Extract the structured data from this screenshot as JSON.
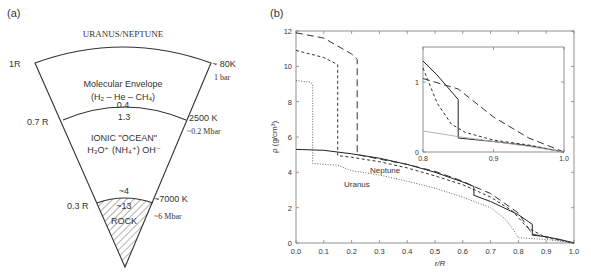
{
  "panel_a": {
    "label": "(a)",
    "title": "URANUS/NEPTUNE",
    "radius_labels": [
      "1R",
      "0.7 R",
      "0.3 R"
    ],
    "layers": [
      {
        "name": "Molecular Envelope",
        "composition": "(H₂ – He – CH₄)",
        "density_top": "",
        "density_bottom": "0.4"
      },
      {
        "name": "IONIC \"OCEAN\"",
        "composition": "H₃O⁺ (NH₄⁺) OH⁻",
        "density_top": "1.3",
        "density_bottom": "~4"
      },
      {
        "name": "ROCK",
        "composition": "",
        "density_top": "~13",
        "density_bottom": ""
      }
    ],
    "boundary_conditions": [
      {
        "temperature": "~ 80K",
        "pressure": "1 bar"
      },
      {
        "temperature": "2500 K",
        "pressure": "~0.2 Mbar"
      },
      {
        "temperature": "~7000 K",
        "pressure": "~6 Mbar"
      }
    ]
  },
  "panel_b": {
    "label": "(b)",
    "curve_labels": {
      "neptune": "Neptune",
      "uranus": "Uranus"
    }
  },
  "chart_data": [
    {
      "type": "line",
      "title": "(b) Density profiles of Uranus and Neptune",
      "xlabel": "r/R",
      "ylabel": "ρ (g/cm³)",
      "xlim": [
        0.0,
        1.0
      ],
      "ylim": [
        0,
        12
      ],
      "xticks": [
        "0.0",
        "0.1",
        "0.2",
        "0.3",
        "0.4",
        "0.5",
        "0.6",
        "0.7",
        "0.8",
        "0.9",
        "1.0"
      ],
      "yticks": [
        "0",
        "2",
        "4",
        "6",
        "8",
        "10",
        "12"
      ],
      "grid": false,
      "annotations": [
        "Neptune",
        "Uranus"
      ],
      "series": [
        {
          "name": "Neptune (solid)",
          "style": "solid",
          "x": [
            0.0,
            0.1,
            0.2,
            0.3,
            0.4,
            0.5,
            0.6,
            0.64,
            0.64,
            0.7,
            0.8,
            0.85,
            0.85,
            0.9,
            0.95,
            1.0
          ],
          "y": [
            5.3,
            5.25,
            5.05,
            4.8,
            4.45,
            4.0,
            3.45,
            3.2,
            2.7,
            2.35,
            1.6,
            1.05,
            0.45,
            0.35,
            0.2,
            0.0
          ]
        },
        {
          "name": "Model (long dash)",
          "style": "long-dash",
          "x": [
            0.0,
            0.1,
            0.2,
            0.22,
            0.22,
            0.3,
            0.4,
            0.5,
            0.6,
            0.64,
            0.7,
            0.8,
            0.85,
            0.9,
            1.0
          ],
          "y": [
            11.9,
            11.6,
            10.7,
            10.4,
            5.0,
            4.75,
            4.45,
            4.05,
            3.5,
            3.2,
            2.8,
            1.7,
            0.5,
            0.35,
            0.0
          ]
        },
        {
          "name": "Model (short dash)",
          "style": "short-dash",
          "x": [
            0.0,
            0.1,
            0.15,
            0.15,
            0.2,
            0.3,
            0.4,
            0.5,
            0.6,
            0.7,
            0.78,
            0.83,
            0.9,
            1.0
          ],
          "y": [
            10.9,
            10.5,
            10.1,
            4.95,
            4.85,
            4.6,
            4.25,
            3.8,
            3.3,
            2.6,
            1.8,
            0.9,
            0.3,
            0.0
          ]
        },
        {
          "name": "Uranus (dotted)",
          "style": "dotted",
          "x": [
            0.0,
            0.05,
            0.06,
            0.06,
            0.15,
            0.2,
            0.3,
            0.4,
            0.5,
            0.6,
            0.7,
            0.75,
            0.78,
            0.8,
            0.9,
            1.0
          ],
          "y": [
            9.2,
            9.1,
            9.0,
            4.5,
            4.4,
            4.1,
            3.85,
            3.5,
            3.1,
            2.6,
            2.0,
            1.4,
            0.8,
            0.3,
            0.2,
            0.0
          ]
        }
      ]
    },
    {
      "type": "line",
      "title": "Inset: outer region",
      "xlabel": "",
      "ylabel": "",
      "xlim": [
        0.8,
        1.0
      ],
      "ylim": [
        0,
        1.5
      ],
      "xticks": [
        "0.8",
        "0.9",
        "1.0"
      ],
      "yticks": [
        "0",
        "1"
      ],
      "series": [
        {
          "name": "Neptune (solid)",
          "style": "solid",
          "x": [
            0.8,
            0.82,
            0.85,
            0.85,
            0.9,
            0.95,
            1.0
          ],
          "y": [
            1.3,
            1.1,
            0.75,
            0.2,
            0.15,
            0.09,
            0.0
          ]
        },
        {
          "name": "Model (long dash)",
          "style": "long-dash",
          "x": [
            0.8,
            0.85,
            0.9,
            0.95,
            1.0
          ],
          "y": [
            1.05,
            0.9,
            0.5,
            0.2,
            0.0
          ]
        },
        {
          "name": "Model (short dash)",
          "style": "short-dash",
          "x": [
            0.8,
            0.82,
            0.84,
            0.86,
            0.9,
            0.95,
            1.0
          ],
          "y": [
            1.2,
            0.7,
            0.4,
            0.28,
            0.17,
            0.1,
            0.0
          ]
        },
        {
          "name": "Uranus (dotted)",
          "style": "dotted-gray",
          "x": [
            0.8,
            0.85,
            0.9,
            0.95,
            1.0
          ],
          "y": [
            0.3,
            0.22,
            0.15,
            0.08,
            0.0
          ]
        }
      ]
    }
  ]
}
